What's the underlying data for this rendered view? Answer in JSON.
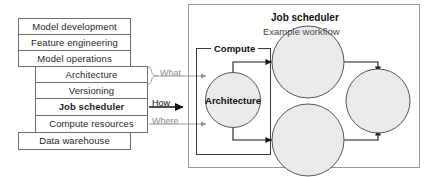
{
  "left_stack": {
    "outer_items": [
      {
        "label": "Model development"
      },
      {
        "label": "Feature engineering"
      },
      {
        "label": "Model operations"
      },
      {
        "label": "Data warehouse"
      }
    ],
    "inner_items": [
      {
        "label": "Architecture",
        "emphasis": "normal"
      },
      {
        "label": "Versioning",
        "emphasis": "normal"
      },
      {
        "label": "Job scheduler",
        "emphasis": "bold"
      },
      {
        "label": "Compute resources",
        "emphasis": "normal"
      }
    ]
  },
  "connectors": {
    "what_label": "What",
    "how_label": "How",
    "where_label": "Where",
    "muted_color": "#8e8e8e",
    "strong_color": "#111111"
  },
  "panel": {
    "title": "Job scheduler",
    "subtitle": "Example workflow",
    "group_label": "Compute",
    "primary_node_label": "Architecture",
    "node_fill": "#eaeaea",
    "node_stroke": "#555555",
    "border_color": "#9a9a9a"
  }
}
